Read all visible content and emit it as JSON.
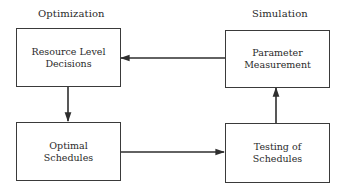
{
  "diagram": {
    "type": "flowchart-cycle",
    "section_labels": {
      "left": "Optimization",
      "right": "Simulation"
    },
    "nodes": [
      {
        "id": "resource-level-decisions",
        "lines": [
          "Resource Level",
          "Decisions"
        ],
        "group": "Optimization",
        "position": "top-left"
      },
      {
        "id": "parameter-measurement",
        "lines": [
          "Parameter",
          "Measurement"
        ],
        "group": "Simulation",
        "position": "top-right"
      },
      {
        "id": "optimal-schedules",
        "lines": [
          "Optimal",
          "Schedules"
        ],
        "group": "Optimization",
        "position": "bottom-left"
      },
      {
        "id": "testing-of-schedules",
        "lines": [
          "Testing of",
          "Schedules"
        ],
        "group": "Simulation",
        "position": "bottom-right"
      }
    ],
    "edges": [
      {
        "from": "resource-level-decisions",
        "to": "optimal-schedules",
        "direction": "down"
      },
      {
        "from": "optimal-schedules",
        "to": "testing-of-schedules",
        "direction": "right"
      },
      {
        "from": "testing-of-schedules",
        "to": "parameter-measurement",
        "direction": "up"
      },
      {
        "from": "parameter-measurement",
        "to": "resource-level-decisions",
        "direction": "left"
      }
    ],
    "colors": {
      "line": "#2e2e2e",
      "text": "#2a2a2a",
      "background": "#ffffff"
    }
  }
}
